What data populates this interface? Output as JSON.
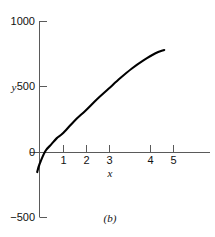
{
  "figure": {
    "caption": "(b)",
    "background_color": "#ffffff",
    "curve_color": "#000000",
    "axis_color": "#5a5a5a"
  },
  "chart_data": {
    "type": "line",
    "title": "",
    "subtitle": "",
    "xlabel": "x",
    "ylabel": "y",
    "xlim": [
      -0.2,
      5.9
    ],
    "ylim": [
      -500,
      1000
    ],
    "xticks": [
      1,
      2,
      3,
      4,
      5
    ],
    "xtick_labels": [
      "1",
      "2",
      "3",
      "4",
      "5"
    ],
    "yticks": [
      -500,
      0,
      500,
      1000
    ],
    "ytick_labels": [
      "−500",
      "0",
      "500",
      "1000"
    ],
    "grid": false,
    "legend": null,
    "legend_position": "none",
    "annotations": [
      "(b)"
    ],
    "series": [
      {
        "name": "y(x)",
        "x": [
          -0.1,
          0.0,
          0.25,
          0.5,
          0.75,
          1.0,
          1.5,
          2.0,
          2.5,
          3.0,
          3.5,
          4.0,
          4.5,
          5.0,
          5.4
        ],
        "y": [
          -150,
          -90,
          10,
          60,
          110,
          145,
          240,
          322,
          410,
          490,
          570,
          643,
          705,
          758,
          785
        ]
      }
    ]
  },
  "axis_labels": {
    "y_axis": "y",
    "x_axis": "x"
  },
  "y_tick_text": {
    "t1000": "1000",
    "t500": "500",
    "t0": "0",
    "tm500": "−500"
  },
  "x_tick_text": {
    "t1": "1",
    "t2": "2",
    "t3": "3",
    "t4": "4",
    "t5": "5"
  }
}
